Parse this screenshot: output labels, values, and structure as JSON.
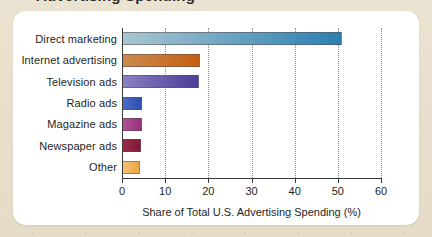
{
  "figure": {
    "clipped_title_fragment": "Advertising Spending",
    "card_background": "#ffffff",
    "page_background": "#e9e1ce"
  },
  "chart_data": {
    "type": "bar",
    "orientation": "horizontal",
    "title": "",
    "xlabel": "Share of Total U.S. Advertising Spending (%)",
    "ylabel": "",
    "xlim": [
      0,
      60
    ],
    "xticks": [
      0,
      10,
      20,
      30,
      40,
      50,
      60
    ],
    "xtick_labels": [
      "0",
      "10",
      "20",
      "30",
      "40",
      "50",
      "60"
    ],
    "grid": "vertical-dotted",
    "legend": "none",
    "categories": [
      "Direct marketing",
      "Internet advertising",
      "Television ads",
      "Radio ads",
      "Magazine ads",
      "Newspaper ads",
      "Other"
    ],
    "values": [
      50.7,
      17.8,
      17.6,
      4.4,
      4.3,
      4.1,
      3.9
    ],
    "bar_colors_start": [
      "#a9c6d2",
      "#cb8a4f",
      "#8c80c1",
      "#4a6bc8",
      "#b35097",
      "#9c2a4b",
      "#f6c173"
    ],
    "bar_colors_end": [
      "#2b7fb1",
      "#c55f12",
      "#4a3d99",
      "#2f4fb0",
      "#98307c",
      "#7d1a38",
      "#eda647"
    ],
    "bars": [
      {
        "label": "Direct marketing",
        "value": 50.7,
        "color_start": "#a9c6d2",
        "color_end": "#2b7fb1"
      },
      {
        "label": "Internet advertising",
        "value": 17.8,
        "color_start": "#cb8a4f",
        "color_end": "#c55f12"
      },
      {
        "label": "Television ads",
        "value": 17.6,
        "color_start": "#8c80c1",
        "color_end": "#4a3d99"
      },
      {
        "label": "Radio ads",
        "value": 4.4,
        "color_start": "#4a6bc8",
        "color_end": "#2f4fb0"
      },
      {
        "label": "Magazine ads",
        "value": 4.3,
        "color_start": "#b35097",
        "color_end": "#98307c"
      },
      {
        "label": "Newspaper ads",
        "value": 4.1,
        "color_start": "#9c2a4b",
        "color_end": "#7d1a38"
      },
      {
        "label": "Other",
        "value": 3.9,
        "color_start": "#f6c173",
        "color_end": "#eda647"
      }
    ]
  }
}
